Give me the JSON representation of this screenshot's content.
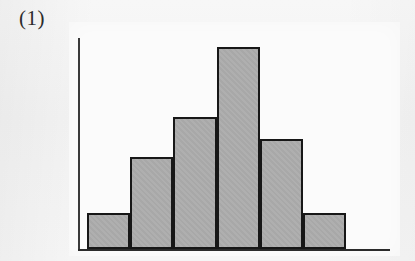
{
  "figure": {
    "label": "(1)"
  },
  "colors": {
    "page_background": "#f4f4f4",
    "panel_background": "#fbfbfb",
    "bar_fill": "#ababab",
    "bar_outline": "#171717",
    "axis": "#2a2a2a"
  },
  "chart_data": {
    "type": "bar",
    "title": "(1)",
    "subtitle": "",
    "xlabel": "",
    "ylabel": "",
    "categories": [
      "1",
      "2",
      "3",
      "4",
      "5",
      "6"
    ],
    "values": [
      1,
      2.55,
      3.67,
      5.61,
      3.06,
      1
    ],
    "series": [
      {
        "name": "frequency",
        "values": [
          1,
          2.55,
          3.67,
          5.61,
          3.06,
          1
        ]
      }
    ],
    "bar_pixel_heights": [
      36,
      92,
      132,
      202,
      110,
      36
    ],
    "ylim": [
      0,
      6.2
    ],
    "xlim": [
      0,
      6
    ],
    "grid": false,
    "legend": null,
    "legend_position": "none",
    "tick_labels_x": [],
    "tick_labels_y": [],
    "annotations": []
  }
}
